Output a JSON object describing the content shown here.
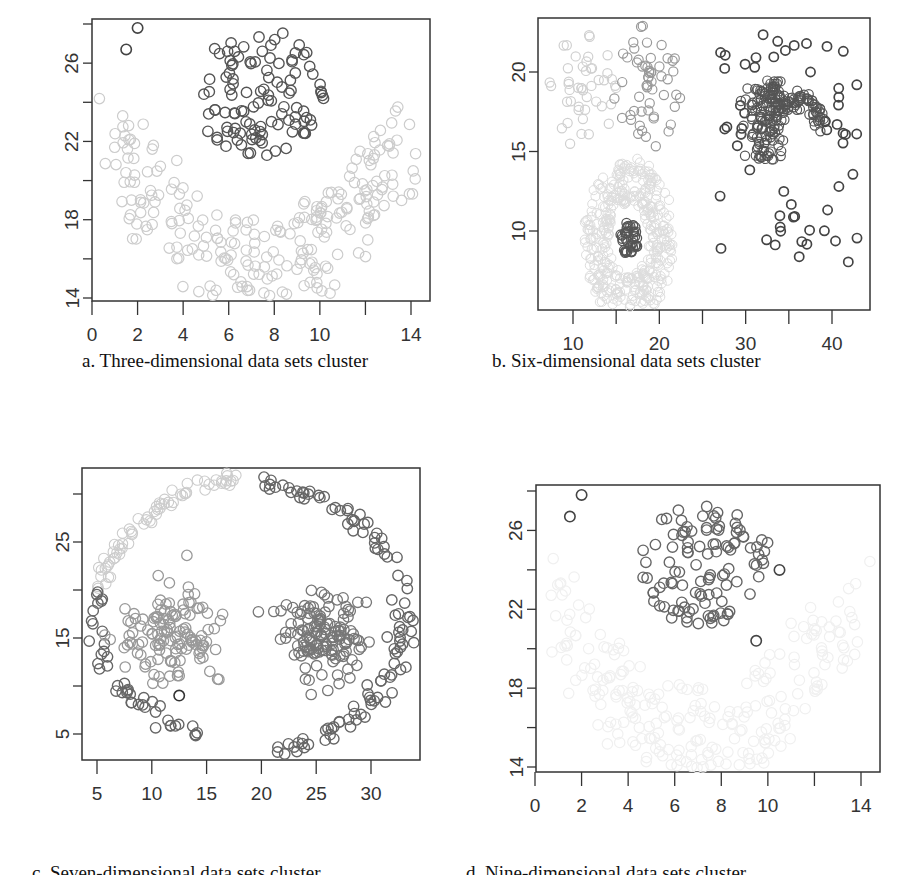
{
  "figure": {
    "captions": {
      "a": "a. Three-dimensional data sets cluster",
      "b": "b. Six-dimensional data sets cluster",
      "c": "c. Seven-dimensional data sets cluster",
      "d": "d. Nine-dimensional data sets cluster"
    }
  },
  "chart_data": [
    {
      "id": "a",
      "type": "scatter",
      "title": "a. Three-dimensional data sets cluster",
      "xlabel": "",
      "ylabel": "",
      "xlim": [
        0,
        15
      ],
      "ylim": [
        14,
        28.5
      ],
      "xticks": [
        0,
        2,
        4,
        6,
        8,
        10,
        12,
        14
      ],
      "xtick_labels": [
        "0",
        "2",
        "4",
        "6",
        "8",
        "10",
        "",
        "14"
      ],
      "yticks": [
        14,
        16,
        18,
        20,
        22,
        24,
        26,
        28
      ],
      "ytick_labels": [
        "14",
        "",
        "18",
        "",
        "22",
        "",
        "26",
        ""
      ],
      "grid": false,
      "marker": "open-circle",
      "series": [
        {
          "name": "cluster-upper-blob",
          "color": "#555555",
          "center": [
            7.3,
            24.5
          ],
          "spread": [
            1.8,
            1.9
          ],
          "count": 110
        },
        {
          "name": "cluster-lower-arc",
          "color": "#cccccc",
          "shape": "u-shaped arc from (1,22.5) down to (7,15) up to (14,23)",
          "count": 260
        },
        {
          "name": "outliers",
          "color": "#444444",
          "points": [
            [
              1.5,
              26.7
            ],
            [
              2,
              27.8
            ]
          ]
        }
      ]
    },
    {
      "id": "b",
      "type": "scatter",
      "title": "b. Six-dimensional data sets cluster",
      "xlim": [
        6,
        44
      ],
      "ylim": [
        5.5,
        23
      ],
      "xticks": [
        10,
        15,
        20,
        25,
        30,
        35,
        40
      ],
      "xtick_labels": [
        "10",
        "",
        "20",
        "",
        "30",
        "",
        "40"
      ],
      "yticks": [
        10,
        15,
        20
      ],
      "ytick_labels": [
        "10",
        "15",
        "20"
      ],
      "grid": false,
      "marker": "open-circle",
      "series": [
        {
          "name": "cluster-top-left-1",
          "color": "#d0d0d0",
          "center": [
            11,
            19
          ],
          "spread": [
            2.5,
            2.5
          ],
          "count": 45
        },
        {
          "name": "cluster-top-left-2",
          "color": "#999999",
          "center": [
            18.5,
            19
          ],
          "spread": [
            2.5,
            2.5
          ],
          "count": 55
        },
        {
          "name": "cluster-ring",
          "color": "#dddddd",
          "center": [
            16.5,
            9.5
          ],
          "ring_radius": [
            3,
            7
          ],
          "count": 400
        },
        {
          "name": "cluster-ring-core",
          "color": "#555555",
          "center": [
            16.5,
            9.5
          ],
          "spread": [
            0.8,
            0.7
          ],
          "count": 40
        },
        {
          "name": "cluster-sparse-grid",
          "color": "#444444",
          "xrange": [
            27,
            43
          ],
          "yrange": [
            8,
            22.5
          ],
          "count": 75
        },
        {
          "name": "cluster-hook",
          "color": "#555555",
          "shape": "dense hook shape around (33,17)",
          "count": 200
        }
      ]
    },
    {
      "id": "c",
      "type": "scatter",
      "title": "c. Seven-dimensional data sets cluster",
      "xlim": [
        4.5,
        35
      ],
      "ylim": [
        2.5,
        32.5
      ],
      "xticks": [
        5,
        10,
        15,
        20,
        25,
        30
      ],
      "xtick_labels": [
        "5",
        "10",
        "15",
        "20",
        "25",
        "30"
      ],
      "yticks": [
        5,
        10,
        15,
        20,
        25,
        30
      ],
      "ytick_labels": [
        "5",
        "",
        "15",
        "",
        "25",
        ""
      ],
      "grid": false,
      "marker": "open-circle",
      "series": [
        {
          "name": "cluster-top-arc",
          "color": "#cccccc",
          "shape": "arc from (6,20) up to (19,31)",
          "count": 70
        },
        {
          "name": "cluster-right-arc",
          "color": "#666666",
          "shape": "arc from (22,30) around right side down to (26,4)",
          "count": 110
        },
        {
          "name": "cluster-left-arc",
          "color": "#666666",
          "shape": "arc from (5,19) down to (11,4.5)",
          "count": 45
        },
        {
          "name": "cluster-left-blob",
          "color": "#999999",
          "center": [
            12,
            15.5
          ],
          "spread": [
            2.8,
            2.8
          ],
          "count": 130
        },
        {
          "name": "cluster-right-blob",
          "color": "#777777",
          "center": [
            25.5,
            15.5
          ],
          "spread": [
            2.5,
            3
          ],
          "count": 140
        },
        {
          "name": "outlier",
          "color": "#333333",
          "points": [
            [
              12.5,
              9
            ]
          ]
        }
      ]
    },
    {
      "id": "d",
      "type": "scatter",
      "title": "d. Nine-dimensional data sets cluster",
      "xlim": [
        0,
        15
      ],
      "ylim": [
        14,
        28.5
      ],
      "xticks": [
        0,
        2,
        4,
        6,
        8,
        10,
        12,
        14
      ],
      "xtick_labels": [
        "0",
        "2",
        "4",
        "6",
        "8",
        "10",
        "",
        "14"
      ],
      "yticks": [
        14,
        16,
        18,
        20,
        22,
        24,
        26,
        28
      ],
      "ytick_labels": [
        "14",
        "",
        "18",
        "",
        "22",
        "",
        "26",
        ""
      ],
      "grid": false,
      "marker": "open-circle",
      "series": [
        {
          "name": "cluster-upper-blob",
          "color": "#666666",
          "center": [
            7.3,
            24.3
          ],
          "spread": [
            1.8,
            1.8
          ],
          "count": 110
        },
        {
          "name": "cluster-lower-arc",
          "color": "#f0f0f0",
          "shape": "faint u-shaped arc",
          "count": 260
        },
        {
          "name": "outliers",
          "color": "#444444",
          "points": [
            [
              1.5,
              26.7
            ],
            [
              2,
              27.8
            ],
            [
              10.5,
              24
            ],
            [
              9.5,
              20.4
            ]
          ]
        }
      ]
    }
  ]
}
